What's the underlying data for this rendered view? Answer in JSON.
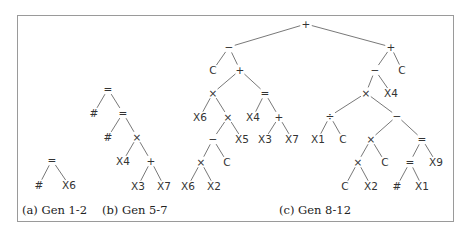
{
  "figure": {
    "panels": [
      {
        "id": "a",
        "caption": "(a) Gen 1-2",
        "caption_pos": [
          22,
          203
        ],
        "nodes": [
          {
            "id": "a0",
            "label": "=",
            "x": 52,
            "y": 160
          },
          {
            "id": "a1",
            "label": "#",
            "x": 39,
            "y": 185
          },
          {
            "id": "a2",
            "label": "X6",
            "x": 69,
            "y": 185
          }
        ],
        "edges": [
          [
            "a0",
            "a1"
          ],
          [
            "a0",
            "a2"
          ]
        ]
      },
      {
        "id": "b",
        "caption": "(b) Gen 5-7",
        "caption_pos": [
          102,
          203
        ],
        "nodes": [
          {
            "id": "b0",
            "label": "=",
            "x": 108,
            "y": 89
          },
          {
            "id": "b1",
            "label": "#",
            "x": 94,
            "y": 113
          },
          {
            "id": "b2",
            "label": "=",
            "x": 123,
            "y": 113
          },
          {
            "id": "b3",
            "label": "#",
            "x": 108,
            "y": 137
          },
          {
            "id": "b4",
            "label": "×",
            "x": 137,
            "y": 137
          },
          {
            "id": "b5",
            "label": "X4",
            "x": 123,
            "y": 161
          },
          {
            "id": "b6",
            "label": "+",
            "x": 151,
            "y": 161
          },
          {
            "id": "b7",
            "label": "X3",
            "x": 138,
            "y": 186
          },
          {
            "id": "b8",
            "label": "X7",
            "x": 164,
            "y": 186
          }
        ],
        "edges": [
          [
            "b0",
            "b1"
          ],
          [
            "b0",
            "b2"
          ],
          [
            "b2",
            "b3"
          ],
          [
            "b2",
            "b4"
          ],
          [
            "b4",
            "b5"
          ],
          [
            "b4",
            "b6"
          ],
          [
            "b6",
            "b7"
          ],
          [
            "b6",
            "b8"
          ]
        ]
      },
      {
        "id": "c",
        "caption": "(c) Gen 8-12",
        "caption_pos": [
          279,
          203
        ],
        "nodes": [
          {
            "id": "c0",
            "label": "+",
            "x": 306,
            "y": 24
          },
          {
            "id": "c1",
            "label": "−",
            "x": 229,
            "y": 47
          },
          {
            "id": "c2",
            "label": "C",
            "x": 213,
            "y": 70
          },
          {
            "id": "c3",
            "label": "+",
            "x": 240,
            "y": 70
          },
          {
            "id": "c4",
            "label": "×",
            "x": 213,
            "y": 93
          },
          {
            "id": "c5",
            "label": "=",
            "x": 265,
            "y": 93
          },
          {
            "id": "c6",
            "label": "X6",
            "x": 200,
            "y": 117
          },
          {
            "id": "c7",
            "label": "×",
            "x": 228,
            "y": 117
          },
          {
            "id": "c8",
            "label": "X4",
            "x": 253,
            "y": 117
          },
          {
            "id": "c9",
            "label": "+",
            "x": 279,
            "y": 117
          },
          {
            "id": "c10",
            "label": "−",
            "x": 213,
            "y": 139
          },
          {
            "id": "c11",
            "label": "X5",
            "x": 242,
            "y": 139
          },
          {
            "id": "c12",
            "label": "X3",
            "x": 265,
            "y": 139
          },
          {
            "id": "c13",
            "label": "X7",
            "x": 292,
            "y": 139
          },
          {
            "id": "c14",
            "label": "×",
            "x": 201,
            "y": 162
          },
          {
            "id": "c15",
            "label": "C",
            "x": 227,
            "y": 162
          },
          {
            "id": "c16",
            "label": "X6",
            "x": 188,
            "y": 186
          },
          {
            "id": "c17",
            "label": "X2",
            "x": 214,
            "y": 186
          },
          {
            "id": "c18",
            "label": "+",
            "x": 391,
            "y": 47
          },
          {
            "id": "c19",
            "label": "−",
            "x": 375,
            "y": 70
          },
          {
            "id": "c20",
            "label": "C",
            "x": 402,
            "y": 70
          },
          {
            "id": "c21",
            "label": "×",
            "x": 366,
            "y": 93
          },
          {
            "id": "c22",
            "label": "X4",
            "x": 391,
            "y": 93
          },
          {
            "id": "c23",
            "label": "÷",
            "x": 330,
            "y": 116
          },
          {
            "id": "c24",
            "label": "−",
            "x": 397,
            "y": 116
          },
          {
            "id": "c25",
            "label": "X1",
            "x": 318,
            "y": 139
          },
          {
            "id": "c26",
            "label": "C",
            "x": 343,
            "y": 139
          },
          {
            "id": "c27",
            "label": "×",
            "x": 371,
            "y": 139
          },
          {
            "id": "c28",
            "label": "=",
            "x": 422,
            "y": 139
          },
          {
            "id": "c29",
            "label": "×",
            "x": 358,
            "y": 162
          },
          {
            "id": "c30",
            "label": "C",
            "x": 385,
            "y": 162
          },
          {
            "id": "c31",
            "label": "=",
            "x": 410,
            "y": 162
          },
          {
            "id": "c32",
            "label": "X9",
            "x": 436,
            "y": 162
          },
          {
            "id": "c33",
            "label": "C",
            "x": 345,
            "y": 186
          },
          {
            "id": "c34",
            "label": "X2",
            "x": 371,
            "y": 186
          },
          {
            "id": "c35",
            "label": "#",
            "x": 397,
            "y": 186
          },
          {
            "id": "c36",
            "label": "X1",
            "x": 422,
            "y": 186
          }
        ],
        "edges": [
          [
            "c0",
            "c1"
          ],
          [
            "c0",
            "c18"
          ],
          [
            "c1",
            "c2"
          ],
          [
            "c1",
            "c3"
          ],
          [
            "c3",
            "c4"
          ],
          [
            "c3",
            "c5"
          ],
          [
            "c4",
            "c6"
          ],
          [
            "c4",
            "c7"
          ],
          [
            "c5",
            "c8"
          ],
          [
            "c5",
            "c9"
          ],
          [
            "c7",
            "c10"
          ],
          [
            "c7",
            "c11"
          ],
          [
            "c9",
            "c12"
          ],
          [
            "c9",
            "c13"
          ],
          [
            "c10",
            "c14"
          ],
          [
            "c10",
            "c15"
          ],
          [
            "c14",
            "c16"
          ],
          [
            "c14",
            "c17"
          ],
          [
            "c18",
            "c19"
          ],
          [
            "c18",
            "c20"
          ],
          [
            "c19",
            "c21"
          ],
          [
            "c19",
            "c22"
          ],
          [
            "c21",
            "c23"
          ],
          [
            "c21",
            "c24"
          ],
          [
            "c23",
            "c25"
          ],
          [
            "c23",
            "c26"
          ],
          [
            "c24",
            "c27"
          ],
          [
            "c24",
            "c28"
          ],
          [
            "c27",
            "c29"
          ],
          [
            "c27",
            "c30"
          ],
          [
            "c28",
            "c31"
          ],
          [
            "c28",
            "c32"
          ],
          [
            "c29",
            "c33"
          ],
          [
            "c29",
            "c34"
          ],
          [
            "c31",
            "c35"
          ],
          [
            "c31",
            "c36"
          ]
        ]
      }
    ]
  }
}
